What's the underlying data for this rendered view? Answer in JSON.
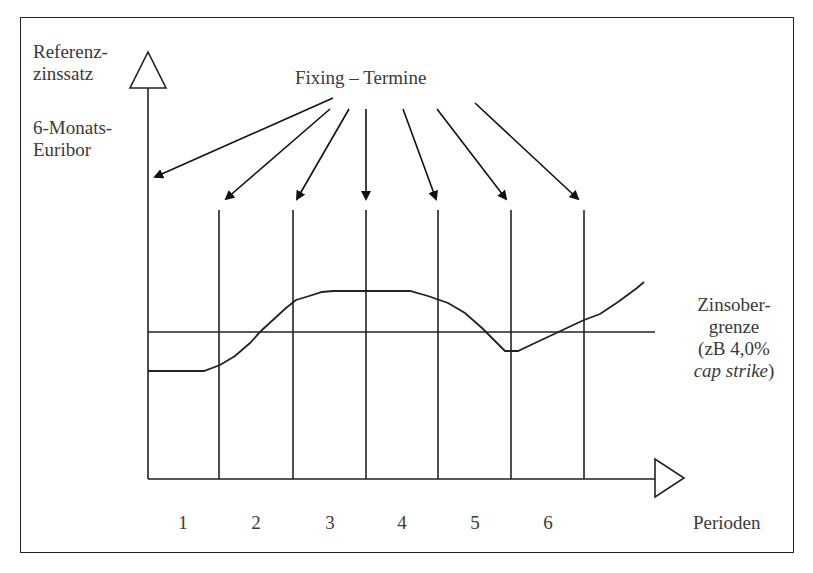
{
  "diagram": {
    "y_axis_label": [
      "Referenz-",
      "zinssatz"
    ],
    "rate_label": [
      "6-Monats-",
      "Euribor"
    ],
    "fixing_label": "Fixing – Termine",
    "cap_label": {
      "line1": "Zinsober-",
      "line2": "grenze",
      "line3": "(zB 4,0%",
      "line4_italic": "cap strike",
      "line4_suffix": ")"
    },
    "x_axis_label": "Perioden",
    "periods": [
      "1",
      "2",
      "3",
      "4",
      "5",
      "6"
    ]
  }
}
